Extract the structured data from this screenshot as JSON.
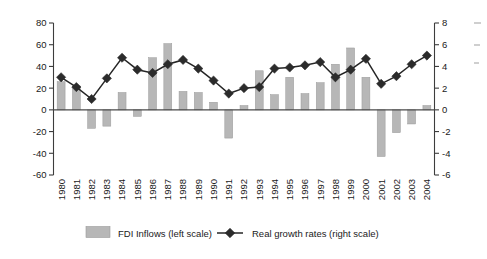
{
  "chart_data": {
    "type": "bar",
    "title": "",
    "subtitle": "",
    "xlabel": "",
    "ylabel": "",
    "grid": false,
    "legend_position": "bottom",
    "categories": [
      "1980",
      "1981",
      "1982",
      "1983",
      "1984",
      "1985",
      "1986",
      "1987",
      "1988",
      "1989",
      "1990",
      "1991",
      "1992",
      "1993",
      "1994",
      "1995",
      "1996",
      "1997",
      "1998",
      "1999",
      "2000",
      "2001",
      "2002",
      "2003",
      "2004"
    ],
    "left_axis": {
      "name": "FDI Inflows (left scale)",
      "ylim": [
        -60,
        80
      ],
      "ticks": [
        80,
        60,
        40,
        20,
        0,
        -20,
        -40,
        -60
      ],
      "tick_labels": [
        "80",
        "60",
        "40",
        "20",
        "0",
        "-20",
        "-40",
        "-60"
      ]
    },
    "right_axis": {
      "name": "Real growth rates (right scale)",
      "ylim": [
        -6,
        8
      ],
      "ticks": [
        8,
        6,
        4,
        2,
        0,
        -2,
        -4,
        -6
      ],
      "tick_labels": [
        "8",
        "6",
        "4",
        "2",
        "0",
        "-2",
        "-4",
        "-6"
      ]
    },
    "series": [
      {
        "name": "FDI Inflows (left scale)",
        "type": "bar",
        "axis": "left",
        "color": "#b7b7b7",
        "values": [
          26,
          22,
          -17,
          -15,
          16,
          -6,
          48,
          61,
          17,
          16,
          7,
          -26,
          4,
          36,
          14,
          30,
          15,
          25,
          42,
          57,
          30,
          -43,
          -21,
          -13,
          4
        ]
      },
      {
        "name": "Real growth rates (right scale)",
        "type": "line",
        "axis": "right",
        "color": "#2b2b2b",
        "marker": "diamond",
        "values": [
          3.0,
          2.1,
          1.0,
          2.9,
          4.8,
          3.7,
          3.4,
          4.2,
          4.6,
          3.8,
          2.7,
          1.5,
          2.0,
          2.1,
          3.8,
          3.9,
          4.1,
          4.4,
          3.0,
          3.7,
          4.7,
          2.4,
          3.1,
          4.2,
          5.0
        ]
      }
    ]
  },
  "legend": {
    "items": [
      {
        "label": "FDI Inflows (left scale)",
        "marker": "bar-swatch"
      },
      {
        "label": "Real growth rates (right scale)",
        "marker": "diamond-line"
      }
    ]
  }
}
